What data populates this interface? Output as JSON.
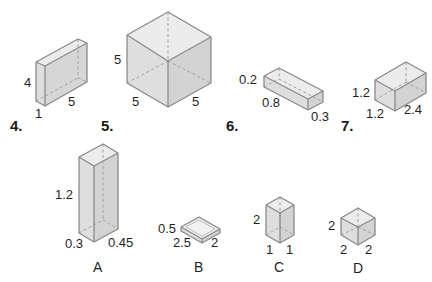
{
  "problems": [
    {
      "number": "4.",
      "dims": {
        "height": "4",
        "depth": "1",
        "width": "5"
      }
    },
    {
      "number": "5.",
      "dims": {
        "height": "5",
        "left": "5",
        "right": "5"
      }
    },
    {
      "number": "6.",
      "dims": {
        "height": "0.2",
        "length": "0.8",
        "width": "0.3"
      }
    },
    {
      "number": "7.",
      "dims": {
        "height": "1.2",
        "left": "1.2",
        "right": "2.4"
      }
    }
  ],
  "options": [
    {
      "letter": "A",
      "dims": {
        "height": "1.2",
        "left": "0.3",
        "right": "0.45"
      }
    },
    {
      "letter": "B",
      "dims": {
        "height": "0.5",
        "left": "2.5",
        "right": "2"
      }
    },
    {
      "letter": "C",
      "dims": {
        "height": "2",
        "left": "1",
        "right": "1"
      }
    },
    {
      "letter": "D",
      "dims": {
        "height": "2",
        "left": "2",
        "right": "2"
      }
    }
  ],
  "colors": {
    "edge": "#8a8a8a",
    "face_light": "#ececec",
    "face_mid": "#dedede",
    "face_dark": "#d3d3d3"
  }
}
